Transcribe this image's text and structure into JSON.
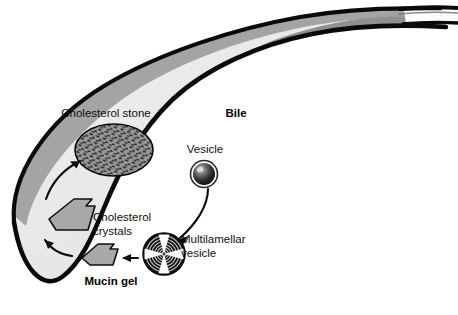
{
  "figure": {
    "title_alt": "Gallbladder bile composition diagram",
    "background_color": "#ffffff"
  },
  "colors": {
    "outline": "#0a0a0a",
    "bile_light": "#e9e9e9",
    "wall_shade": "#8b8b8b",
    "wall_shade_mid": "#9d9d9d",
    "crystal_fill": "#a8a8a8",
    "stone_fill": "#9a9a9a",
    "stone_speck": "#111111",
    "vesicle_dark": "#1a1a1a",
    "vesicle_highlight": "#d9d9d9",
    "mlv_dark": "#111111",
    "mlv_cross": "#ffffff",
    "duct_lumen": "#fbfbfb",
    "label_text": "#101010"
  },
  "labels": {
    "cholesterol_stone": "Cholesterol stone",
    "bile": "Bile",
    "vesicle": "Vesicle",
    "cholesterol_crystals_line1": "Cholesterol",
    "cholesterol_crystals_line2": "crystals",
    "multilamellar_line1": "Multilamellar",
    "multilamellar_line2": "vesicle",
    "mucin_gel": "Mucin gel"
  },
  "elements": {
    "gallbladder": "gallbladder-outline",
    "cystic_duct": "cystic-duct",
    "stone": "cholesterol-stone-shape",
    "crystal_large": "cholesterol-crystal-large",
    "crystal_small": "cholesterol-crystal-small",
    "vesicle": "vesicle-sphere",
    "multilamellar_vesicle": "multilamellar-vesicle-shape"
  },
  "arrows": [
    {
      "name": "arrow-crystal-to-stone",
      "from": "cholesterol-crystal-large",
      "to": "cholesterol-stone",
      "style": "curved"
    },
    {
      "name": "arrow-smallcrystal-to-largecrystal",
      "from": "cholesterol-crystal-small",
      "to": "cholesterol-crystal-large",
      "style": "curved"
    },
    {
      "name": "arrow-mlv-to-crystal",
      "from": "multilamellar-vesicle",
      "to": "cholesterol-crystal-small",
      "style": "straight"
    },
    {
      "name": "arrow-vesicle-to-mlv",
      "from": "vesicle",
      "to": "multilamellar-vesicle",
      "style": "curved"
    }
  ]
}
